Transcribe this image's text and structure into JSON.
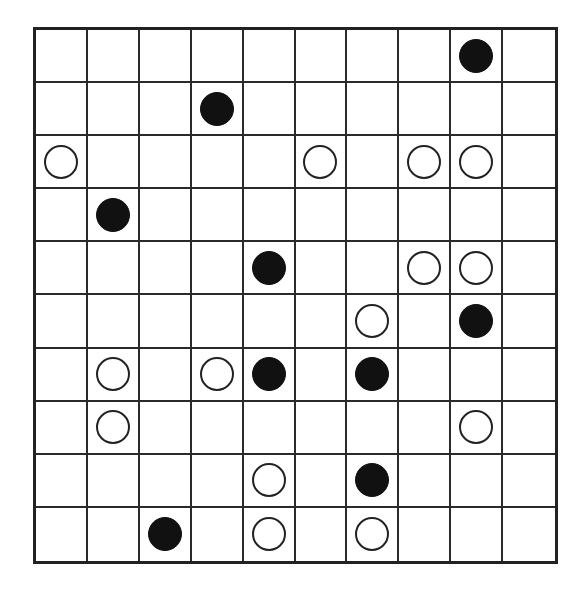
{
  "board": {
    "rows": 10,
    "cols": 10,
    "colors": {
      "black": "#111111",
      "white": "#ffffff",
      "grid": "#2a2a2a"
    },
    "stones": [
      {
        "row": 0,
        "col": 8,
        "color": "black"
      },
      {
        "row": 1,
        "col": 3,
        "color": "black"
      },
      {
        "row": 2,
        "col": 0,
        "color": "white"
      },
      {
        "row": 2,
        "col": 5,
        "color": "white"
      },
      {
        "row": 2,
        "col": 7,
        "color": "white"
      },
      {
        "row": 2,
        "col": 8,
        "color": "white"
      },
      {
        "row": 3,
        "col": 1,
        "color": "black"
      },
      {
        "row": 4,
        "col": 4,
        "color": "black"
      },
      {
        "row": 4,
        "col": 7,
        "color": "white"
      },
      {
        "row": 4,
        "col": 8,
        "color": "white"
      },
      {
        "row": 5,
        "col": 6,
        "color": "white"
      },
      {
        "row": 5,
        "col": 8,
        "color": "black"
      },
      {
        "row": 6,
        "col": 1,
        "color": "white"
      },
      {
        "row": 6,
        "col": 3,
        "color": "white"
      },
      {
        "row": 6,
        "col": 4,
        "color": "black"
      },
      {
        "row": 6,
        "col": 6,
        "color": "black"
      },
      {
        "row": 7,
        "col": 1,
        "color": "white"
      },
      {
        "row": 7,
        "col": 8,
        "color": "white"
      },
      {
        "row": 8,
        "col": 4,
        "color": "white"
      },
      {
        "row": 8,
        "col": 6,
        "color": "black"
      },
      {
        "row": 9,
        "col": 2,
        "color": "black"
      },
      {
        "row": 9,
        "col": 4,
        "color": "white"
      },
      {
        "row": 9,
        "col": 6,
        "color": "white"
      }
    ]
  }
}
